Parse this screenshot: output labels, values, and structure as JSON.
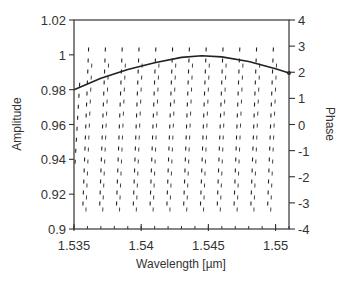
{
  "chart_data": {
    "type": "line",
    "title": "",
    "xlabel": "Wavelength [µm]",
    "ylabel": "Amplitude",
    "y2label": "Phase",
    "xlim": [
      1.535,
      1.551
    ],
    "ylim": [
      0.9,
      1.02
    ],
    "y2lim": [
      -4,
      4
    ],
    "grid": false,
    "legend": null,
    "x_ticks": [
      1.535,
      1.54,
      1.545,
      1.55
    ],
    "x_tick_labels": [
      "1.535",
      "1.54",
      "1.545",
      "1.55"
    ],
    "x_minor_step": 0.001,
    "y_ticks": [
      1.02,
      1.0,
      0.98,
      0.96,
      0.94,
      0.92,
      0.9
    ],
    "y_tick_labels": [
      "1.02",
      "1",
      "0.98",
      "0.96",
      "0.94",
      "0.92",
      "0.9"
    ],
    "y2_ticks": [
      4,
      3,
      2,
      1,
      0,
      -1,
      -2,
      -3,
      -4
    ],
    "y2_tick_labels": [
      "4",
      "3",
      "2",
      "1",
      "0",
      "-1",
      "-2",
      "-3",
      "-4"
    ],
    "series": [
      {
        "name": "Amplitude",
        "axis": "left",
        "style": "solid",
        "x": [
          1.535,
          1.537,
          1.539,
          1.541,
          1.543,
          1.5445,
          1.546,
          1.548,
          1.55,
          1.551
        ],
        "y": [
          0.98,
          0.9865,
          0.9915,
          0.9955,
          0.9985,
          0.9995,
          0.9988,
          0.9962,
          0.992,
          0.9895
        ]
      },
      {
        "name": "Phase",
        "axis": "right",
        "style": "dashed",
        "wrapped": true,
        "period_um": 0.00125,
        "range": [
          -3.1,
          3.1
        ],
        "wrap_points_um": [
          1.5361,
          1.53735,
          1.5386,
          1.53985,
          1.5411,
          1.54235,
          1.5436,
          1.54485,
          1.5461,
          1.54735,
          1.5486,
          1.54985
        ]
      }
    ]
  },
  "labels": {
    "xlabel": "Wavelength [µm]",
    "ylabel": "Amplitude",
    "y2label": "Phase"
  }
}
